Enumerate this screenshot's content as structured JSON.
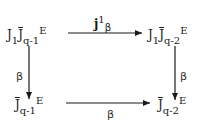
{
  "diagram": {
    "type": "commutative-square",
    "nodes": {
      "top_left": {
        "base": "J",
        "base_sub": "1",
        "bar": "J",
        "bar_sub": "q-1",
        "tail": "E"
      },
      "top_right": {
        "base": "J",
        "base_sub": "1",
        "bar": "J",
        "bar_sub": "q-2",
        "tail": "E"
      },
      "bottom_left": {
        "bar": "J",
        "bar_sub": "q-1",
        "tail": "E"
      },
      "bottom_right": {
        "bar": "J",
        "bar_sub": "q-2",
        "tail": "E"
      }
    },
    "arrows": {
      "top": {
        "from": "top_left",
        "to": "top_right",
        "label_main": "j",
        "label_sup": "1",
        "label_sub": "β"
      },
      "left": {
        "from": "top_left",
        "to": "bottom_left",
        "label": "β"
      },
      "right": {
        "from": "top_right",
        "to": "bottom_right",
        "label": "β"
      },
      "bottom": {
        "from": "bottom_left",
        "to": "bottom_right",
        "label": "β"
      }
    },
    "line_color": "#1a1a1a"
  }
}
